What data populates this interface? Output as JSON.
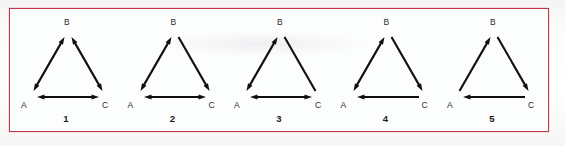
{
  "figure": {
    "panel_border_color": "#c0374a",
    "background_color": "#fcfdfd",
    "stroke_color": "#101010",
    "vertex_labels": [
      "A",
      "B",
      "C"
    ],
    "diagrams": [
      {
        "number": "1",
        "label_a": "A",
        "label_b": "B",
        "label_c": "C",
        "edges": [
          {
            "name": "edge-a-b",
            "from": "A",
            "to": "B",
            "heads": "both",
            "description": "A and B double arrow"
          },
          {
            "name": "edge-b-c",
            "from": "B",
            "to": "C",
            "heads": "both",
            "description": "B and C double arrow"
          },
          {
            "name": "edge-a-c",
            "from": "A",
            "to": "C",
            "heads": "both",
            "description": "A and C double arrow"
          }
        ]
      },
      {
        "number": "2",
        "label_a": "A",
        "label_b": "B",
        "label_c": "C",
        "edges": [
          {
            "name": "edge-a-b",
            "from": "A",
            "to": "B",
            "heads": "both",
            "description": "A and B double arrow"
          },
          {
            "name": "edge-b-c",
            "from": "B",
            "to": "C",
            "heads": "to",
            "description": "B to C single arrow"
          },
          {
            "name": "edge-a-c",
            "from": "A",
            "to": "C",
            "heads": "both",
            "description": "A and C double arrow"
          }
        ]
      },
      {
        "number": "3",
        "label_a": "A",
        "label_b": "B",
        "label_c": "C",
        "edges": [
          {
            "name": "edge-a-b",
            "from": "A",
            "to": "B",
            "heads": "both",
            "description": "A and B double arrow"
          },
          {
            "name": "edge-b-c",
            "from": "B",
            "to": "C",
            "heads": "none",
            "description": "B to C plain line, no arrowheads"
          },
          {
            "name": "edge-a-c",
            "from": "A",
            "to": "C",
            "heads": "both",
            "description": "A and C double arrow"
          }
        ]
      },
      {
        "number": "4",
        "label_a": "A",
        "label_b": "B",
        "label_c": "C",
        "edges": [
          {
            "name": "edge-a-b",
            "from": "A",
            "to": "B",
            "heads": "both",
            "description": "A and B double arrow"
          },
          {
            "name": "edge-b-c",
            "from": "B",
            "to": "C",
            "heads": "to",
            "description": "B to C single arrow"
          },
          {
            "name": "edge-a-c",
            "from": "C",
            "to": "A",
            "heads": "to",
            "description": "C to A single arrow"
          }
        ]
      },
      {
        "number": "5",
        "label_a": "A",
        "label_b": "B",
        "label_c": "C",
        "edges": [
          {
            "name": "edge-a-b",
            "from": "A",
            "to": "B",
            "heads": "to",
            "description": "A to B single arrow"
          },
          {
            "name": "edge-b-c",
            "from": "B",
            "to": "C",
            "heads": "to",
            "description": "B to C single arrow"
          },
          {
            "name": "edge-a-c",
            "from": "C",
            "to": "A",
            "heads": "to",
            "description": "C to A single arrow"
          }
        ]
      }
    ]
  }
}
